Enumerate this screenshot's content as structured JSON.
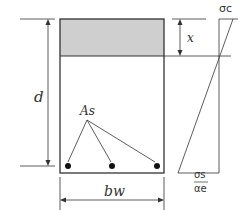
{
  "diagram": {
    "labels": {
      "depth": "d",
      "neutral_axis": "x",
      "steel_area": "As",
      "width": "bw",
      "concrete_stress": "σc",
      "steel_stress_num": "σs",
      "steel_stress_den": "αe"
    },
    "colors": {
      "line": "#333333",
      "compression_zone": "#cfcfcf",
      "background": "#ffffff"
    },
    "bars": 3
  }
}
